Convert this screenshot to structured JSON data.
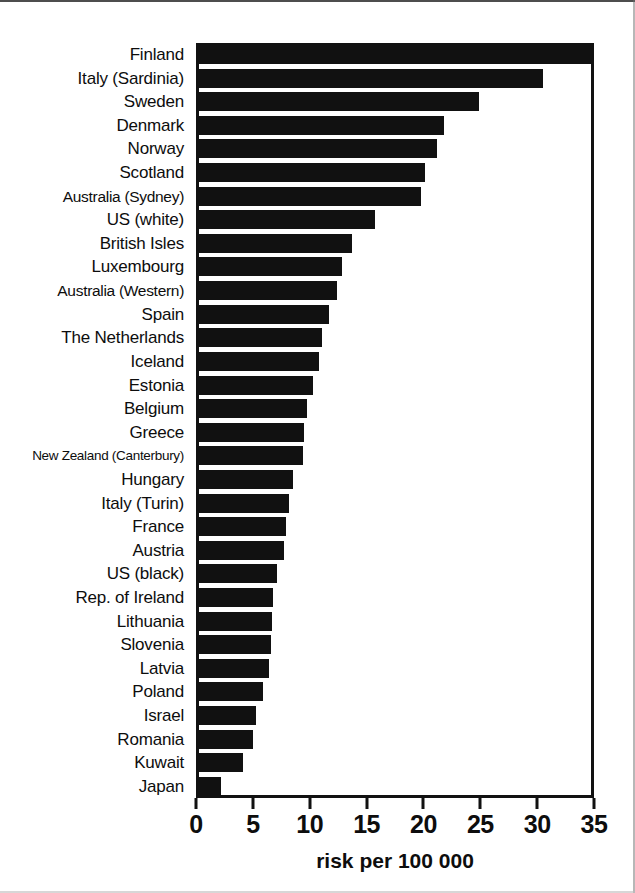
{
  "chart_data": {
    "type": "bar",
    "orientation": "horizontal",
    "title": "",
    "xlabel": "risk per  100 000",
    "ylabel": "",
    "xlim": [
      0,
      35
    ],
    "xticks": [
      0,
      5,
      10,
      15,
      20,
      25,
      30,
      35
    ],
    "xtick_labels": [
      "0",
      "5",
      "10",
      "15",
      "20",
      "25",
      "30",
      "35"
    ],
    "grid": false,
    "legend": null,
    "bar_color": "#111111",
    "background_color": "#ffffff",
    "categories": [
      "Finland",
      "Italy (Sardinia)",
      "Sweden",
      "Denmark",
      "Norway",
      "Scotland",
      "Australia (Sydney)",
      "US (white)",
      "British Isles",
      "Luxembourg",
      "Australia (Western)",
      "Spain",
      "The Netherlands",
      "Iceland",
      "Estonia",
      "Belgium",
      "Greece",
      "New Zealand (Canterbury)",
      "Hungary",
      "Italy (Turin)",
      "France",
      "Austria",
      "US (black)",
      "Rep. of Ireland",
      "Lithuania",
      "Slovenia",
      "Latvia",
      "Poland",
      "Israel",
      "Romania",
      "Kuwait",
      "Japan"
    ],
    "values": [
      34.9,
      30.5,
      24.9,
      21.8,
      21.2,
      20.1,
      19.8,
      15.7,
      13.7,
      12.8,
      12.4,
      11.7,
      11.1,
      10.8,
      10.3,
      9.8,
      9.5,
      9.4,
      8.5,
      8.2,
      7.9,
      7.7,
      7.1,
      6.8,
      6.7,
      6.6,
      6.4,
      5.9,
      5.3,
      5.0,
      4.1,
      2.2
    ]
  },
  "axis": {
    "x_title": "risk per  100 000"
  }
}
